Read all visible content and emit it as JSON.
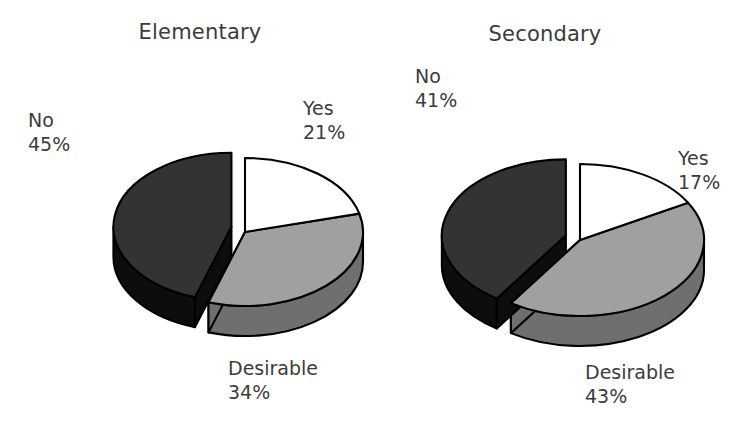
{
  "figure": {
    "background": "#ffffff",
    "text_color": "#3c3c3c",
    "outline_color": "#000000"
  },
  "chart_data": [
    {
      "type": "pie",
      "title": "Elementary",
      "categories": [
        "Yes",
        "Desirable",
        "No"
      ],
      "values": [
        21,
        34,
        45
      ],
      "labels": [
        "21%",
        "34%",
        "45%"
      ],
      "colors": [
        "#ffffff",
        "#a0a0a0",
        "#333333"
      ],
      "side_colors": [
        "#b8b8b8",
        "#6f6f6f",
        "#0d0d0d"
      ],
      "exploded": [
        "No"
      ],
      "three_d": true,
      "xlabel": "",
      "ylabel": "",
      "legend": "none",
      "grid": false
    },
    {
      "type": "pie",
      "title": "Secondary",
      "categories": [
        "Yes",
        "Desirable",
        "No"
      ],
      "values": [
        17,
        43,
        41
      ],
      "labels": [
        "17%",
        "43%",
        "41%"
      ],
      "colors": [
        "#ffffff",
        "#a0a0a0",
        "#333333"
      ],
      "side_colors": [
        "#b8b8b8",
        "#6f6f6f",
        "#0d0d0d"
      ],
      "exploded": [
        "No"
      ],
      "three_d": true,
      "xlabel": "",
      "ylabel": "",
      "legend": "none",
      "grid": false
    }
  ],
  "charts": {
    "elementary": {
      "title": "Elementary",
      "slices": {
        "no": {
          "name": "No",
          "pct": "45%"
        },
        "yes": {
          "name": "Yes",
          "pct": "21%"
        },
        "desirable": {
          "name": "Desirable",
          "pct": "34%"
        }
      }
    },
    "secondary": {
      "title": "Secondary",
      "slices": {
        "no": {
          "name": "No",
          "pct": "41%"
        },
        "yes": {
          "name": "Yes",
          "pct": "17%"
        },
        "desirable": {
          "name": "Desirable",
          "pct": "43%"
        }
      }
    }
  }
}
